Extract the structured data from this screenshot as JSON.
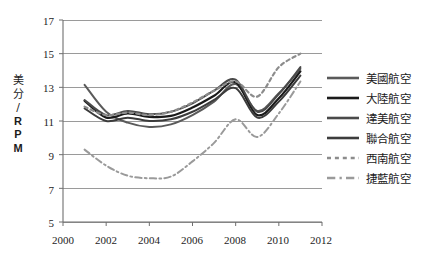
{
  "chart_data": {
    "type": "line",
    "title": "",
    "subtitle": "",
    "xlabel": "",
    "ylabel": "美分/RPM",
    "ylabel_chars": [
      "美",
      "分",
      "/",
      "R",
      "P",
      "M"
    ],
    "xlim": [
      2000,
      2012
    ],
    "ylim": [
      5,
      17
    ],
    "xticks": [
      2000,
      2002,
      2004,
      2006,
      2008,
      2010,
      2012
    ],
    "xtick_labels": [
      "2000",
      "2002",
      "2004",
      "2006",
      "2008",
      "2010",
      "2012"
    ],
    "yticks": [
      5,
      7,
      9,
      11,
      13,
      15,
      17
    ],
    "ytick_labels": [
      "5",
      "7",
      "9",
      "11",
      "13",
      "15",
      "17"
    ],
    "grid": "horizontal",
    "legend_position": "right",
    "x": [
      2001,
      2002,
      2003,
      2004,
      2005,
      2006,
      2007,
      2008,
      2009,
      2010,
      2011
    ],
    "series": [
      {
        "name": "美國航空",
        "color": "#5a5a5a",
        "style": "solid",
        "width": 2.0,
        "values": [
          13.15,
          11.55,
          10.9,
          10.65,
          10.8,
          11.35,
          12.15,
          13.2,
          11.6,
          12.65,
          14.1
        ]
      },
      {
        "name": "大陸航空",
        "color": "#1a1a1a",
        "style": "solid",
        "width": 2.2,
        "values": [
          12.2,
          11.2,
          11.45,
          11.25,
          11.3,
          11.8,
          12.5,
          13.3,
          11.35,
          12.35,
          13.95
        ]
      },
      {
        "name": "達美航空",
        "color": "#4a4a4a",
        "style": "solid",
        "width": 2.0,
        "values": [
          12.25,
          11.35,
          11.6,
          11.4,
          11.55,
          12.05,
          12.8,
          13.45,
          11.55,
          12.6,
          14.2
        ]
      },
      {
        "name": "聯合航空",
        "color": "#3c3c3c",
        "style": "solid",
        "width": 2.0,
        "values": [
          11.75,
          11.0,
          11.2,
          11.0,
          11.1,
          11.55,
          12.25,
          12.95,
          11.2,
          12.15,
          13.7
        ]
      },
      {
        "name": "西南航空",
        "color": "#8c8c8c",
        "style": "dotted",
        "width": 2.2,
        "values": [
          11.85,
          11.35,
          11.5,
          11.35,
          11.55,
          12.1,
          12.8,
          13.35,
          12.45,
          14.2,
          15.0
        ]
      },
      {
        "name": "捷藍航空",
        "color": "#9a9a9a",
        "style": "dashdot",
        "width": 2.0,
        "values": [
          9.3,
          8.35,
          7.75,
          7.6,
          7.7,
          8.6,
          9.7,
          11.1,
          10.05,
          11.45,
          13.35
        ]
      }
    ]
  },
  "legend": {
    "items": [
      {
        "label": "美國航空",
        "style": "solid",
        "color": "#5a5a5a"
      },
      {
        "label": "大陸航空",
        "style": "solid",
        "color": "#1a1a1a"
      },
      {
        "label": "達美航空",
        "style": "solid",
        "color": "#4a4a4a"
      },
      {
        "label": "聯合航空",
        "style": "solid",
        "color": "#3c3c3c"
      },
      {
        "label": "西南航空",
        "style": "dotted",
        "color": "#8c8c8c"
      },
      {
        "label": "捷藍航空",
        "style": "dashdot",
        "color": "#9a9a9a"
      }
    ]
  },
  "axes": {
    "y_title_chars": [
      "美",
      "分",
      "/",
      "R",
      "P",
      "M"
    ],
    "y_labels": [
      "17",
      "15",
      "13",
      "11",
      "9",
      "7",
      "5"
    ],
    "x_labels": [
      "2000",
      "2002",
      "2004",
      "2006",
      "2008",
      "2010",
      "2012"
    ]
  },
  "colors": {
    "grid": "#8f8f8f",
    "axis": "#6f6f6f",
    "text": "#1d1d1d",
    "background": "#ffffff"
  }
}
